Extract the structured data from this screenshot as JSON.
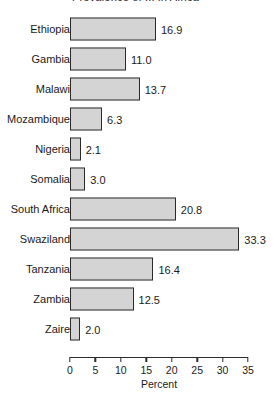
{
  "chart_data": {
    "type": "bar",
    "orientation": "horizontal",
    "title": "Prevalence of ... in Africa",
    "xlabel": "Percent",
    "ylabel": "",
    "xlim": [
      0,
      35
    ],
    "xticks": [
      0,
      5,
      10,
      15,
      20,
      25,
      30,
      35
    ],
    "grid": false,
    "legend": null,
    "categories": [
      "Ethiopia",
      "Gambia",
      "Malawi",
      "Mozambique",
      "Nigeria",
      "Somalia",
      "South Africa",
      "Swaziland",
      "Tanzania",
      "Zambia",
      "Zaire"
    ],
    "values": [
      16.9,
      11.0,
      13.7,
      6.3,
      2.1,
      3.0,
      20.8,
      33.3,
      16.4,
      12.5,
      2.0
    ],
    "value_labels": [
      "16.9",
      "11.0",
      "13.7",
      "6.3",
      "2.1",
      "3.0",
      "20.8",
      "33.3",
      "16.4",
      "12.5",
      "2.0"
    ],
    "tick_labels": [
      "0",
      "5",
      "10",
      "15",
      "20",
      "25",
      "30",
      "35"
    ],
    "bar_fill_color": "#dedede",
    "bar_edge_color": "#2a2a2a"
  }
}
